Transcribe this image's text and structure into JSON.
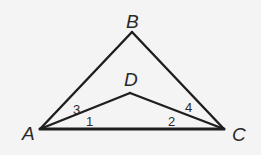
{
  "diagram": {
    "type": "geometry",
    "points": {
      "A": {
        "label": "A",
        "x": 40,
        "y": 129
      },
      "B": {
        "label": "B",
        "x": 132,
        "y": 32
      },
      "C": {
        "label": "C",
        "x": 224,
        "y": 129
      },
      "D": {
        "label": "D",
        "x": 130,
        "y": 93
      }
    },
    "segments": [
      [
        "A",
        "B"
      ],
      [
        "B",
        "C"
      ],
      [
        "A",
        "C"
      ],
      [
        "A",
        "D"
      ],
      [
        "D",
        "C"
      ]
    ],
    "angle_labels": {
      "angle1": "1",
      "angle2": "2",
      "angle3": "3",
      "angle4": "4"
    },
    "colors": {
      "stroke": "#1e1e1e",
      "text": "#2a2a2a",
      "background": "#f4f4f4"
    }
  }
}
